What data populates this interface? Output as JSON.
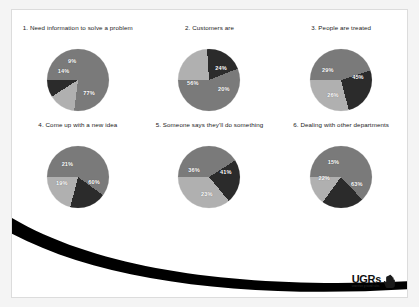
{
  "slide": {
    "background_color": "#ffffff",
    "border_color": "#dcdcdc"
  },
  "logo": {
    "word": "UGRs",
    "tagline": "unwritten ground rules",
    "mark_name": "pointing-hand-icon"
  },
  "palette": {
    "slice_dark": "#2b2b2b",
    "slice_medium": "#7a7a7a",
    "slice_light": "#b0b0b0",
    "label_text": "#ffffff",
    "title_text": "#1a1a1a",
    "swoosh": "#000000"
  },
  "chart_data": [
    {
      "type": "pie",
      "title": "1. Need information to solve a problem",
      "labels": [
        "77%",
        "14%",
        "9%"
      ],
      "values": [
        77,
        14,
        9
      ],
      "colors": [
        "#7a7a7a",
        "#b0b0b0",
        "#2b2b2b"
      ],
      "legend": "none"
    },
    {
      "type": "pie",
      "title": "2. Customers are",
      "labels": [
        "24%",
        "20%",
        "56%"
      ],
      "values": [
        24,
        20,
        56
      ],
      "colors": [
        "#b0b0b0",
        "#2b2b2b",
        "#7a7a7a"
      ],
      "legend": "none"
    },
    {
      "type": "pie",
      "title": "3. People are treated",
      "labels": [
        "45%",
        "26%",
        "29%"
      ],
      "values": [
        45,
        26,
        29
      ],
      "colors": [
        "#7a7a7a",
        "#2b2b2b",
        "#b0b0b0"
      ],
      "legend": "none"
    },
    {
      "type": "pie",
      "title": "4. Come up with a new idea",
      "labels": [
        "60%",
        "19%",
        "21%"
      ],
      "values": [
        60,
        19,
        21
      ],
      "colors": [
        "#7a7a7a",
        "#2b2b2b",
        "#b0b0b0"
      ],
      "legend": "none"
    },
    {
      "type": "pie",
      "title": "5. Someone says they'll do something",
      "labels": [
        "41%",
        "23%",
        "36%"
      ],
      "values": [
        41,
        23,
        36
      ],
      "colors": [
        "#7a7a7a",
        "#2b2b2b",
        "#b0b0b0"
      ],
      "legend": "none"
    },
    {
      "type": "pie",
      "title": "6. Dealing with other departments",
      "labels": [
        "63%",
        "22%",
        "15%"
      ],
      "values": [
        63,
        22,
        15
      ],
      "colors": [
        "#7a7a7a",
        "#2b2b2b",
        "#b0b0b0"
      ],
      "legend": "none"
    }
  ]
}
